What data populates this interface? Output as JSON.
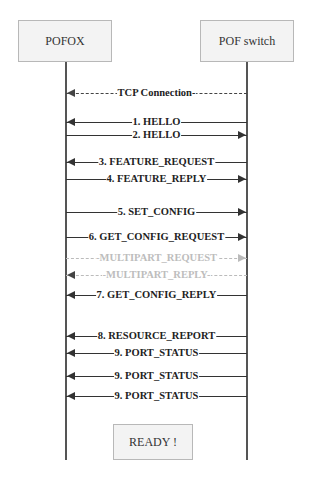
{
  "participants": {
    "left": "POFOX",
    "right": "POF switch"
  },
  "messages": [
    {
      "label": "TCP Connection-",
      "direction": "left",
      "style": "dashed",
      "y": 86
    },
    {
      "label": "1. HELLO",
      "direction": "left",
      "style": "solid",
      "y": 115
    },
    {
      "label": "2. HELLO",
      "direction": "right",
      "style": "solid",
      "y": 128
    },
    {
      "label": "3. FEATURE_REQUEST",
      "direction": "left",
      "style": "solid",
      "y": 155
    },
    {
      "label": "4. FEATURE_REPLY",
      "direction": "right",
      "style": "solid",
      "y": 172
    },
    {
      "label": "5. SET_CONFIG",
      "direction": "right",
      "style": "solid",
      "y": 205
    },
    {
      "label": "6. GET_CONFIG_REQUEST",
      "direction": "right",
      "style": "solid",
      "y": 230
    },
    {
      "label": "-MULTIPART_REQUEST",
      "direction": "right",
      "style": "gray-dashed",
      "y": 251
    },
    {
      "label": "-MULTIPART_REPLY-",
      "direction": "left",
      "style": "gray-dashed",
      "y": 268
    },
    {
      "label": "7. GET_CONFIG_REPLY",
      "direction": "left",
      "style": "solid",
      "y": 288
    },
    {
      "label": "8. RESOURCE_REPORT",
      "direction": "left",
      "style": "solid",
      "y": 329
    },
    {
      "label": "9. PORT_STATUS",
      "direction": "left",
      "style": "solid",
      "y": 346
    },
    {
      "label": "9. PORT_STATUS",
      "direction": "left",
      "style": "solid",
      "y": 369
    },
    {
      "label": "9. PORT_STATUS",
      "direction": "left",
      "style": "solid",
      "y": 389
    }
  ],
  "final_state": "READY !",
  "colors": {
    "box_fill": "#f3f3f3",
    "box_border": "#b8b8b8",
    "line": "#333333",
    "gray_message": "#bbbbbb"
  }
}
